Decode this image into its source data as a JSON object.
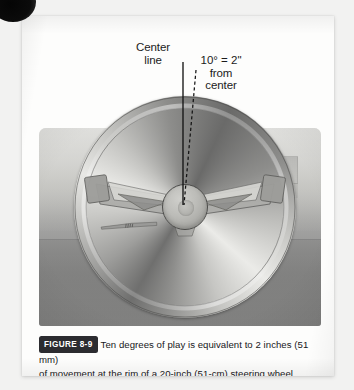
{
  "figure": {
    "badge_label": "FIGURE 8-9",
    "caption_line1": "Ten degrees of play is equivalent to 2 inches (51 mm)",
    "caption_line2": "of movement at the rim of a 20-inch (51-cm) steering wheel.",
    "annotations": {
      "center_line": {
        "line1": "Center",
        "line2": "line"
      },
      "offset": {
        "line1": "10° = 2\"",
        "line2": "from",
        "line3": "center"
      }
    },
    "illustration": {
      "subject": "steering-wheel",
      "rim_style": "chrome",
      "spoke_count": 3,
      "gauges_visible": 4,
      "center_line_style": "solid",
      "offset_line_style": "dashed",
      "offset_angle_degrees": 10
    },
    "colors": {
      "paper": "#fdfdfc",
      "page_background": "#f2f2f1",
      "badge_background": "#2c2c30",
      "badge_text": "#ffffff",
      "caption_text": "#17171a",
      "annotation_text": "#1b1b1b",
      "photo_upper": "#d5d5d3",
      "photo_lower": "#868685",
      "rim_highlight": "#ebebe8",
      "rim_shadow": "#6a6a69",
      "hub_fill": "#bcbcb8",
      "line_color": "#141414"
    }
  }
}
